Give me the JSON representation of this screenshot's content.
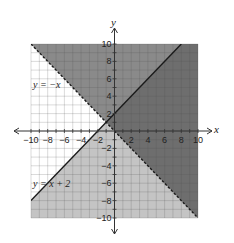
{
  "chart_data": {
    "type": "line",
    "title": "",
    "xlabel": "x",
    "ylabel": "y",
    "xlim": [
      -10,
      10
    ],
    "ylim": [
      -10,
      10
    ],
    "grid": true,
    "grid_step": 1,
    "x_ticks": [
      -10,
      -8,
      -6,
      -4,
      -2,
      2,
      4,
      6,
      8,
      10
    ],
    "y_ticks": [
      10,
      8,
      6,
      4,
      2,
      -2,
      -4,
      -6,
      -8,
      -10
    ],
    "x_tick_labels": [
      "−10",
      "−8",
      "−6",
      "−4",
      "−2",
      "2",
      "4",
      "6",
      "8",
      "10"
    ],
    "y_tick_labels": [
      "10",
      "8",
      "6",
      "4",
      "2",
      "−2",
      "−4",
      "−6",
      "−8",
      "−10"
    ],
    "series": [
      {
        "name": "y = −x",
        "equation": "y = -x",
        "style": "dashed",
        "points": [
          [
            -10,
            10
          ],
          [
            10,
            -10
          ]
        ],
        "shading": "above"
      },
      {
        "name": "y = x + 2",
        "equation": "y = x + 2",
        "style": "solid",
        "points": [
          [
            -10,
            -8
          ],
          [
            8,
            10
          ]
        ],
        "shading": "below"
      }
    ],
    "regions": [
      {
        "name": "above y=-x only",
        "color": "#8a8a8a"
      },
      {
        "name": "below y=x+2 only",
        "color": "#c4c4c4"
      },
      {
        "name": "overlap (solution)",
        "color": "#6e6e6e"
      },
      {
        "name": "unshaded",
        "color": "#ffffff"
      }
    ],
    "annotations": [
      {
        "text": "y = −x",
        "x": -9,
        "y": 5.5
      },
      {
        "text": "y = x + 2",
        "x": -9,
        "y": -6
      }
    ]
  },
  "labels": {
    "x_axis": "x",
    "y_axis": "y",
    "line1": "y = −x",
    "line2": "y = x + 2"
  },
  "colors": {
    "dark_region": "#6e6e6e",
    "mid_region": "#8a8a8a",
    "light_region": "#c4c4c4",
    "grid_light": "#b8b8b8",
    "axis": "#333333",
    "line": "#1a1a1a"
  }
}
